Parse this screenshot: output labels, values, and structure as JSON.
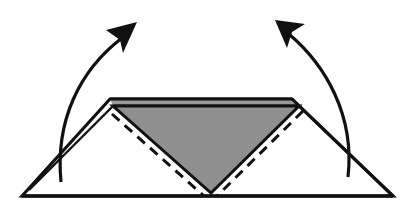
{
  "diagram": {
    "description": "Origami folding step: two side flaps of a paper triangle are folded up along dashed valley-fold lines",
    "colors": {
      "background": "#ffffff",
      "stroke": "#111111",
      "paper_front": "#ffffff",
      "paper_back": "#8f8f8f",
      "paper_edge_layer": "#9a9a9a"
    },
    "elements": [
      {
        "id": "base-triangle",
        "type": "paper-shape",
        "fill": "white"
      },
      {
        "id": "center-flap",
        "type": "paper-shape",
        "fill": "gray",
        "shape": "inverted-triangle"
      },
      {
        "id": "fold-line-left",
        "type": "valley-fold",
        "style": "dashed"
      },
      {
        "id": "fold-line-right",
        "type": "valley-fold",
        "style": "dashed"
      },
      {
        "id": "arrow-left",
        "type": "fold-arrow",
        "direction": "up-right"
      },
      {
        "id": "arrow-right",
        "type": "fold-arrow",
        "direction": "up-left"
      }
    ]
  }
}
